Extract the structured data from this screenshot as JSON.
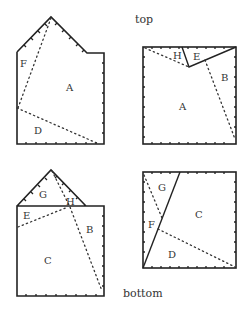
{
  "captions": {
    "top": "top",
    "bottom": "bottom"
  },
  "figures": {
    "top_left": {
      "labels": {
        "F": "F",
        "A": "A",
        "D": "D"
      }
    },
    "top_right": {
      "labels": {
        "H": "H",
        "E": "E",
        "B": "B",
        "A": "A"
      }
    },
    "bottom_left": {
      "labels": {
        "G": "G",
        "H": "H",
        "E": "E",
        "B": "B",
        "C": "C"
      }
    },
    "bottom_right": {
      "labels": {
        "G": "G",
        "C": "C",
        "F": "F",
        "D": "D"
      }
    }
  },
  "colors": {
    "line": "#222222",
    "background": "#ffffff"
  }
}
